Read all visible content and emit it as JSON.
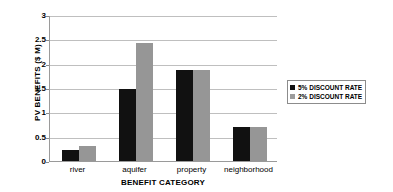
{
  "chart_data": {
    "type": "bar",
    "title": "",
    "xlabel": "BENEFIT CATEGORY",
    "ylabel": "PV BENEFITS ($ M)",
    "categories": [
      "river",
      "aquifer",
      "property",
      "neighborhood"
    ],
    "series": [
      {
        "name": "5% DISCOUNT RATE",
        "color": "#111111",
        "values": [
          0.22,
          1.49,
          1.87,
          0.7
        ]
      },
      {
        "name": "2% DISCOUNT RATE",
        "color": "#969696",
        "values": [
          0.3,
          2.43,
          1.87,
          0.7
        ]
      }
    ],
    "ylim": [
      0,
      3
    ],
    "yticks": [
      0,
      0.5,
      1,
      1.5,
      2,
      2.5,
      3
    ],
    "ytick_labels": [
      "0",
      "0.5",
      "1",
      "1.5",
      "2",
      "2.5",
      "3"
    ],
    "grid": true,
    "legend_position": "right",
    "legend": [
      {
        "label": "5% DISCOUNT RATE",
        "swatch": "black-square"
      },
      {
        "label": "2% DISCOUNT RATE",
        "swatch": "gray-square"
      }
    ]
  }
}
